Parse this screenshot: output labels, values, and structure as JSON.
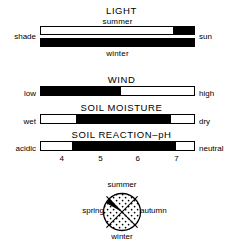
{
  "figure": {
    "panels": [
      {
        "id": "light",
        "title": "LIGHT",
        "sub_top": "summer",
        "sub_bottom": "winter",
        "left_label": "shade",
        "right_label": "sun",
        "bars": [
          {
            "id": "light-summer",
            "fill_start_pct": 86,
            "fill_end_pct": 100
          },
          {
            "id": "light-winter",
            "fill_start_pct": 0,
            "fill_end_pct": 100
          }
        ]
      },
      {
        "id": "wind",
        "title": "WIND",
        "left_label": "low",
        "right_label": "high",
        "bars": [
          {
            "id": "wind",
            "fill_start_pct": 0,
            "fill_end_pct": 52
          }
        ]
      },
      {
        "id": "soil-moisture",
        "title": "SOIL MOISTURE",
        "left_label": "wet",
        "right_label": "dry",
        "bars": [
          {
            "id": "soil-moisture",
            "fill_start_pct": 23,
            "fill_end_pct": 85
          }
        ]
      },
      {
        "id": "soil-reaction",
        "title": "SOIL REACTION–pH",
        "left_label": "acidic",
        "right_label": "neutral",
        "bars": [
          {
            "id": "soil-reaction",
            "fill_start_pct": 20,
            "fill_end_pct": 88
          }
        ],
        "scale_ticks": [
          {
            "label": "4",
            "pos_pct": 14
          },
          {
            "label": "5",
            "pos_pct": 39
          },
          {
            "label": "6",
            "pos_pct": 63
          },
          {
            "label": "7",
            "pos_pct": 88
          }
        ]
      }
    ],
    "season_circle": {
      "id": "flowering-season-circle",
      "top_label": "summer",
      "bottom_label": "winter",
      "left_label": "spring",
      "right_label": "autumn",
      "fill_pattern": "stipple",
      "highlight_wedge": {
        "start_deg": 292,
        "end_deg": 318,
        "color": "#000000"
      }
    },
    "colors": {
      "ink": "#000000",
      "paper": "#ffffff"
    }
  }
}
